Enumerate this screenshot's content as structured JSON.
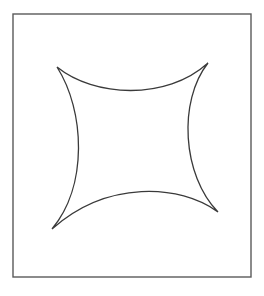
{
  "figure": {
    "kind": "line-drawing",
    "background_color": "#ffffff",
    "canvas": {
      "width": 264,
      "height": 296
    }
  },
  "frame": {
    "name": "border-rectangle",
    "x": 13,
    "y": 14,
    "width": 238,
    "height": 263,
    "stroke_color": "#5a5a5a",
    "stroke_width": 1.4,
    "fill": "none"
  },
  "curve": {
    "name": "astroid-curve",
    "description": "Four concave arcs meeting at four sharp cusps, forming a star-like four-pointed shape",
    "stroke_color": "#3a3a3a",
    "stroke_width": 1.3,
    "fill": "none",
    "closed": true,
    "cusps": [
      {
        "label": "top-left",
        "x": 57,
        "y": 67
      },
      {
        "label": "top-right",
        "x": 208,
        "y": 63
      },
      {
        "label": "bottom-right",
        "x": 218,
        "y": 212
      },
      {
        "label": "bottom-left",
        "x": 52,
        "y": 229
      }
    ],
    "arc_extrema": [
      {
        "label": "top-arc-lowest",
        "x": 135,
        "y": 88
      },
      {
        "label": "right-arc-leftmost",
        "x": 190,
        "y": 140
      },
      {
        "label": "bottom-arc-highest",
        "x": 135,
        "y": 197
      },
      {
        "label": "left-arc-rightmost",
        "x": 76,
        "y": 146
      }
    ],
    "path_d": "M 57 67 C 94 97 166 101 208 63 C 178 101 182 175 218 212 C 180 184 107 180 52 229 C 88 186 85 111 57 67 Z"
  }
}
